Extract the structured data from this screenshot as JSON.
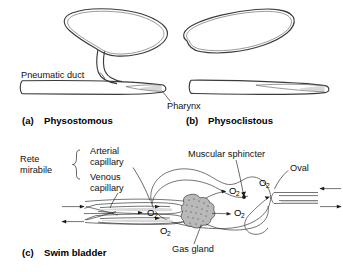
{
  "figure": {
    "background_color": "#ffffff",
    "line_color": "#3b3b3b",
    "text_color": "#111111",
    "gland_color": "#b9b9b9"
  },
  "panels": [
    {
      "id": "a",
      "caption_marker": "(a)",
      "caption_label": "Physostomous",
      "labels": [
        {
          "name": "pneumatic-duct",
          "text": "Pneumatic duct"
        }
      ]
    },
    {
      "id": "b",
      "caption_marker": "(b)",
      "caption_label": "Physoclistous",
      "labels": []
    },
    {
      "id": "c",
      "caption_marker": "(c)",
      "caption_label": "Swim bladder",
      "labels": []
    }
  ],
  "shared_labels": {
    "pharynx": "Pharynx"
  },
  "panel_c_labels": {
    "rete_line1": "Rete",
    "rete_line2": "mirabile",
    "arterial_line1": "Arterial",
    "arterial_line2": "capillary",
    "venous_line1": "Venous",
    "venous_line2": "capillary",
    "muscular_sphincter": "Muscular sphincter",
    "oval": "Oval",
    "gas_gland": "Gas gland"
  },
  "gas_labels": {
    "symbol": "O",
    "subscript": "2",
    "instances": [
      {
        "name": "o2-rete-center"
      },
      {
        "name": "o2-rete-lower"
      },
      {
        "name": "o2-gland-upper"
      },
      {
        "name": "o2-gland-lower"
      },
      {
        "name": "o2-oval"
      }
    ]
  }
}
